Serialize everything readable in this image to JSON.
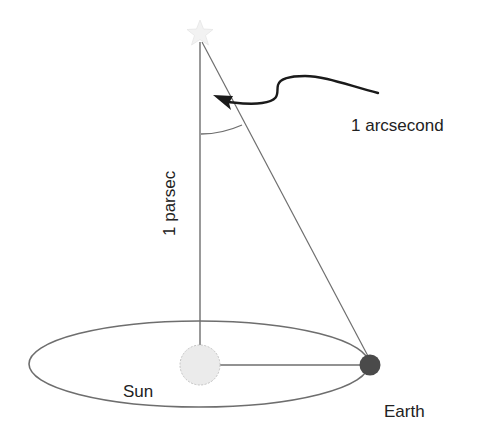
{
  "diagram": {
    "type": "parallax-parsec-diagram",
    "labels": {
      "distance": "1 parsec",
      "angle": "1 arcsecond",
      "sun": "Sun",
      "earth": "Earth"
    },
    "objects": {
      "star": {
        "shape": "star",
        "color": "#f2f2f2"
      },
      "sun": {
        "shape": "circle",
        "color": "#ebebeb",
        "border": "#bdbdbd"
      },
      "earth": {
        "shape": "circle",
        "color": "#4a4a4a"
      },
      "orbit": {
        "shape": "ellipse",
        "color": "#6e6e6e"
      }
    },
    "colors": {
      "line": "#6e6e6e",
      "arrow": "#1a1a1a",
      "text": "#222222",
      "background": "#ffffff"
    }
  }
}
